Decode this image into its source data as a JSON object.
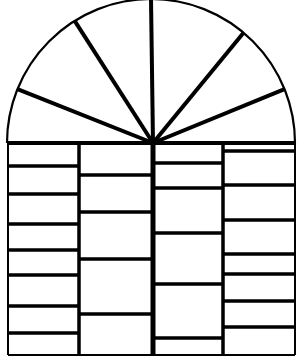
{
  "figure": {
    "width": 301,
    "height": 362,
    "stroke_color": "#000000",
    "background": "#ffffff"
  },
  "arch": {
    "center_x": 151,
    "base_y": 143,
    "radius": 144,
    "hub_x": 153,
    "spoke_angles_deg": [
      22,
      50,
      90,
      122,
      158
    ]
  },
  "frame": {
    "left": 8,
    "right": 295,
    "top": 143,
    "bottom": 355
  },
  "columns": [
    {
      "x0": 8,
      "x1": 79,
      "rows_y": [
        166,
        194,
        224,
        250,
        275,
        306,
        333
      ]
    },
    {
      "x0": 79,
      "x1": 153,
      "rows_y": [
        175,
        212,
        259,
        314
      ]
    },
    {
      "x0": 153,
      "x1": 223,
      "rows_y": [
        163,
        188,
        233,
        284,
        338
      ]
    },
    {
      "x0": 223,
      "x1": 295,
      "rows_y": [
        151,
        185,
        220,
        254,
        274,
        301,
        327
      ]
    }
  ]
}
